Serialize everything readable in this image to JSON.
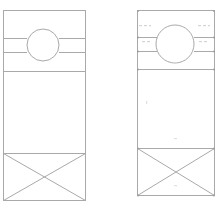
{
  "diagram": {
    "type": "technical-drawing",
    "views": [
      {
        "id": "left-view",
        "outline": {
          "x": 3,
          "y": 10,
          "w": 82,
          "h": 190
        },
        "bands": [
          38,
          52
        ],
        "divider_y": 71,
        "circle": {
          "cx": 43,
          "cy": 45,
          "r": 16
        },
        "cross_box": {
          "y1": 153,
          "y2": 200
        },
        "dimension_labels": []
      },
      {
        "id": "right-view",
        "outline": {
          "x": 137,
          "y": 10,
          "w": 77,
          "h": 185
        },
        "bands": [
          37,
          51
        ],
        "divider_y": 69,
        "circle": {
          "cx": 175,
          "cy": 44,
          "r": 19
        },
        "cross_box": {
          "y1": 148,
          "y2": 195
        },
        "dimension_labels": [
          "(illegible)",
          "(illegible)",
          "(illegible)",
          "(illegible)"
        ]
      }
    ],
    "colors": {
      "line": "#a9a9a9",
      "label": "#c8c8c8"
    }
  }
}
